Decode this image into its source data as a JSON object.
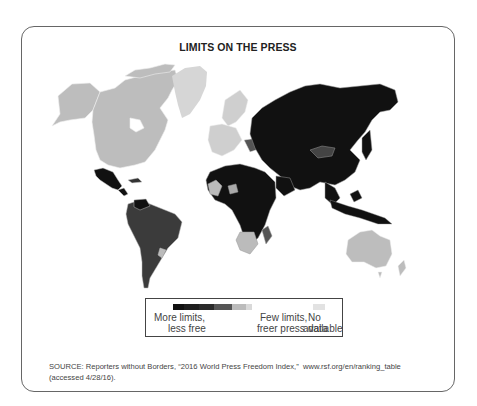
{
  "figure": {
    "title": "LIMITS ON THE PRESS"
  },
  "legend": {
    "ramp_colors": [
      "#111111",
      "#1e1e1e",
      "#2a2a2a",
      "#555555",
      "#bbbbbb",
      "#d9d9d9"
    ],
    "ramp_widths": [
      11,
      15,
      15,
      18,
      14,
      6
    ],
    "left_label_line1": "More limits,",
    "left_label_line2": "less free",
    "mid_label_line1": "Few limits,",
    "mid_label_line2": "freer press",
    "right_label_line1": "No data",
    "right_label_line2": "available",
    "nodata_color": "#e2e2e2"
  },
  "source": {
    "line1": "SOURCE: Reporters without Borders, “2016 World Press Freedom Index,”  www.rsf.org/en/ranking_table",
    "line2": "(accessed 4/28/16)."
  },
  "map": {
    "regions": [
      {
        "name": "North America (USA/Canada)",
        "shade": "light"
      },
      {
        "name": "Greenland",
        "shade": "nodata"
      },
      {
        "name": "Mexico & Central America",
        "shade": "black"
      },
      {
        "name": "South America",
        "shade": "dark-gray"
      },
      {
        "name": "Europe (West)",
        "shade": "light"
      },
      {
        "name": "Russia / Central Asia / China",
        "shade": "black"
      },
      {
        "name": "Mongolia",
        "shade": "dark-gray"
      },
      {
        "name": "Africa (most)",
        "shade": "black"
      },
      {
        "name": "Southern Africa",
        "shade": "light"
      },
      {
        "name": "Southeast Asia",
        "shade": "black"
      },
      {
        "name": "Australia / NZ",
        "shade": "light"
      }
    ]
  }
}
